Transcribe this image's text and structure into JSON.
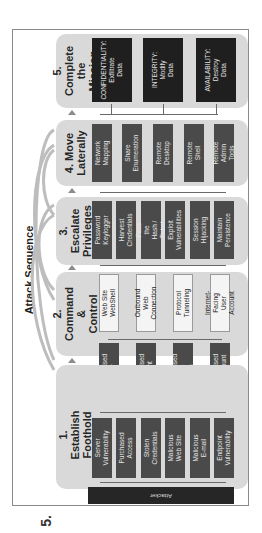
{
  "title": "Attack Sequence",
  "page_marker": "5.",
  "attacker_label": "Attacker",
  "stages": [
    {
      "label": "1. Establish\nFoothold",
      "inputs": [
        "Server\nVulnerability",
        "Purchased\nAccess",
        "Stolen\nCredentials",
        "Malicious\nWeb Site",
        "Malicious\nE-mail",
        "Endpoint\nVulnerability"
      ],
      "outputs": [
        "Compromised\nServer",
        "Compromised\nEndpoint",
        "Compromised\nMobile Device",
        "Compromised\nUser Account"
      ]
    },
    {
      "label": "2. Command &\nControl",
      "items": [
        "Web Site\nWebShell",
        "Outbound Web\nConnection",
        "Protocol\nTunneling",
        "Internet-Facing\nUser Account"
      ]
    },
    {
      "label": "3. Escalate\nPrivileges",
      "items": [
        "Password\nKeylogger",
        "Harvest\nCredentials",
        "Pass the\nHash / Ticket",
        "Exploit\nVulnerabilities",
        "Session\nHijacking",
        "Maintain\nPersistence"
      ]
    },
    {
      "label": "4. Move\nLaterally",
      "items": [
        "Network\nMapping",
        "Share\nEnumeration",
        "Remote\nDesktop",
        "Remote\nShell",
        "Remote\nAdmin Tools"
      ]
    },
    {
      "label": "5. Complete\nthe Mission",
      "items": [
        "CONFIDENTIALITY:\nExfiltrate\nData",
        "INTEGRITY:\nModify\nData",
        "AVAILABILITY:\nDestroy\nData"
      ]
    }
  ],
  "colors": {
    "panel": "#d9d9d9",
    "dark_box": "#4a4a4a",
    "black_box": "#1f1f1f",
    "light_box": "#f4f4f4",
    "connector": "#6a6a6a"
  }
}
